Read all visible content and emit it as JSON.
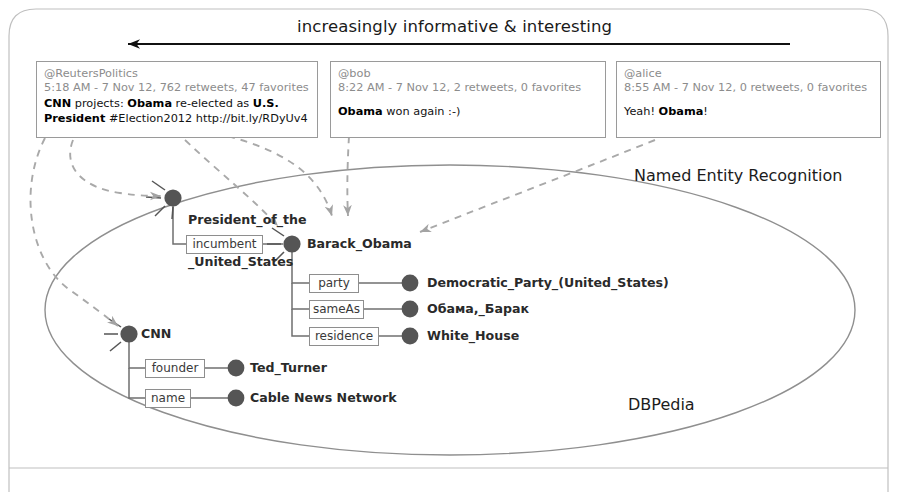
{
  "header": {
    "arrow_caption": "increasingly informative & interesting",
    "arrow_icon": "left-arrow-icon"
  },
  "tweets": [
    {
      "handle": "@ReutersPolitics",
      "meta": "5:18 AM - 7 Nov 12, 762 retweets, 47 favorites",
      "line1_a": "CNN",
      "line1_b": " projects: ",
      "line1_c": "Obama",
      "line1_d": " re-elected as ",
      "line1_e": "U.S.",
      "line2_a": "President",
      "line2_b": " #Election2012 http://bit.ly/RDyUv4"
    },
    {
      "handle": "@bob",
      "meta": "8:22 AM - 7 Nov 12, 2 retweets, 0 favorites",
      "line1_a": "Obama",
      "line1_b": " won again :-)"
    },
    {
      "handle": "@alice",
      "meta": "8:55 AM - 7 Nov 12, 0 retweets, 0 favorites",
      "line1_a": "Yeah! ",
      "line1_b": "Obama",
      "line1_c": "!"
    }
  ],
  "regions": {
    "ner_label": "Named Entity Recognition",
    "dbpedia_label": "DBPedia"
  },
  "graph": {
    "entities": [
      {
        "id": "potus",
        "label_line1": "President_of_the",
        "label_line2": "_United_States"
      },
      {
        "id": "obama",
        "label_line1": "Barack_Obama"
      },
      {
        "id": "dem",
        "label_line1": "Democratic_Party_(United_States)"
      },
      {
        "id": "obama_ru",
        "label_line1": "Обама,_Барак"
      },
      {
        "id": "wh",
        "label_line1": "White_House"
      },
      {
        "id": "cnn",
        "label_line1": "CNN"
      },
      {
        "id": "turner",
        "label_line1": "Ted_Turner"
      },
      {
        "id": "cablenews",
        "label_line1": "Cable News Network"
      }
    ],
    "predicates": [
      {
        "id": "incumbent",
        "label": "incumbent"
      },
      {
        "id": "party",
        "label": "party"
      },
      {
        "id": "sameAs",
        "label": "sameAs"
      },
      {
        "id": "residence",
        "label": "residence"
      },
      {
        "id": "founder",
        "label": "founder"
      },
      {
        "id": "name",
        "label": "name"
      }
    ]
  },
  "colors": {
    "node_fill": "#5a5a5a",
    "edge": "#6f6f6f",
    "dashed_link": "#a9a9a9",
    "frame": "#b5b5b5",
    "ellipse": "#8a8a8a",
    "arrow_black": "#111111"
  }
}
